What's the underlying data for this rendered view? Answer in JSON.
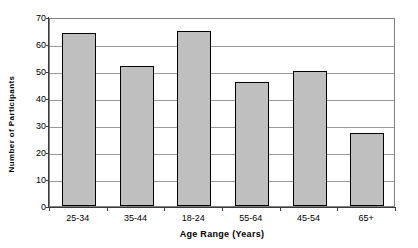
{
  "chart_data": {
    "type": "bar",
    "title": "",
    "xlabel": "Age Range (Years)",
    "ylabel": "Number of Participants",
    "categories": [
      "25-34",
      "35-44",
      "18-24",
      "55-64",
      "45-54",
      "65+"
    ],
    "values": [
      64,
      52,
      65,
      46,
      50,
      27
    ],
    "series": [
      {
        "name": "Number of Participants",
        "values": [
          64,
          52,
          65,
          46,
          50,
          27
        ]
      }
    ],
    "ylim": [
      0,
      70
    ],
    "ytick_step": 10,
    "yticks": [
      70,
      60,
      50,
      40,
      30,
      20,
      10,
      0
    ],
    "ytick_labels": [
      "70",
      "60",
      "50",
      "40",
      "30",
      "20",
      "10",
      "0"
    ],
    "grid": "horizontal",
    "legend": "none",
    "colors": {
      "bar_fill": "#bfbfbf",
      "bar_border": "#000000",
      "gridline": "#9a9a9a",
      "axis": "#3b3b3b",
      "plot_border": "#808080",
      "background": "#ffffff",
      "text": "#000000"
    }
  }
}
